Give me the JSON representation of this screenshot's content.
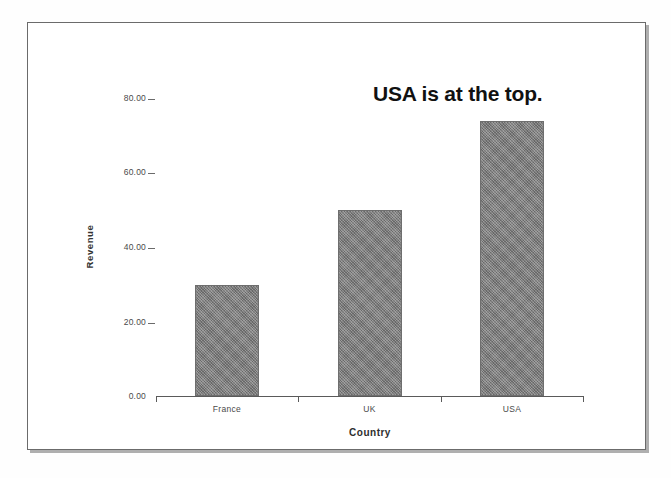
{
  "figure": {
    "annotation": "USA is at the top.",
    "scan_bottom_text_fragment": ""
  },
  "chart_data": {
    "type": "bar",
    "title": "",
    "subtitle": "",
    "annotations": [
      {
        "text": "USA is at the top.",
        "target": "USA"
      }
    ],
    "categories": [
      "France",
      "UK",
      "USA"
    ],
    "values": [
      30.0,
      50.0,
      74.0
    ],
    "series": [
      {
        "name": "Revenue",
        "values": [
          30.0,
          50.0,
          74.0
        ]
      }
    ],
    "xlabel": "Country",
    "ylabel": "Revenue",
    "ylim": [
      0,
      80
    ],
    "ytick_labels": [
      "80.00",
      "60.00",
      "40.00",
      "20.00",
      "0.00"
    ],
    "ytick_values": [
      80,
      60,
      40,
      20,
      0
    ],
    "xtick_labels": [
      "France",
      "UK",
      "USA"
    ],
    "grid": false,
    "legend": false,
    "bar_color": "#7f7f7f",
    "axis_color": "#5a5a5a",
    "background": "#ffffff"
  }
}
